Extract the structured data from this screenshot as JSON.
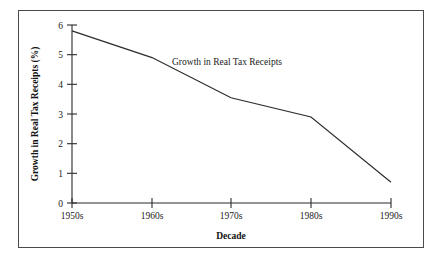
{
  "chart_data": {
    "type": "line",
    "title": "",
    "xlabel": "Decade",
    "ylabel": "Growth in Real Tax Receipts (%)",
    "categories": [
      "1950s",
      "1960s",
      "1970s",
      "1980s",
      "1990s"
    ],
    "series": [
      {
        "name": "Growth in Real Tax Receipts",
        "values": [
          5.8,
          4.9,
          3.55,
          2.9,
          0.7
        ]
      }
    ],
    "ylim": [
      0,
      6
    ],
    "yticks": [
      0,
      1,
      2,
      3,
      4,
      5,
      6
    ],
    "ytick_labels": [
      "0",
      "1",
      "2",
      "3",
      "4",
      "5",
      "6"
    ],
    "xtick_labels": [
      "1950s",
      "1960s",
      "1970s",
      "1980s",
      "1990s"
    ],
    "grid": false,
    "legend": "none",
    "annotations": [
      {
        "text": "Growth in Real Tax Receipts",
        "x": "1965s-region",
        "y": 5.05
      }
    ],
    "line_color": "#2b2b2b",
    "frame_color": "#4a4a4a",
    "background_color": "#ffffff"
  },
  "axis": {
    "y_title": "Growth in Real Tax Receipts (%)",
    "x_title": "Decade",
    "y_ticks": [
      "6",
      "5",
      "4",
      "3",
      "2",
      "1",
      "0"
    ],
    "x_ticks": [
      "1950s",
      "1960s",
      "1970s",
      "1980s",
      "1990s"
    ]
  },
  "annotation": {
    "series_label": "Growth in Real Tax Receipts"
  }
}
